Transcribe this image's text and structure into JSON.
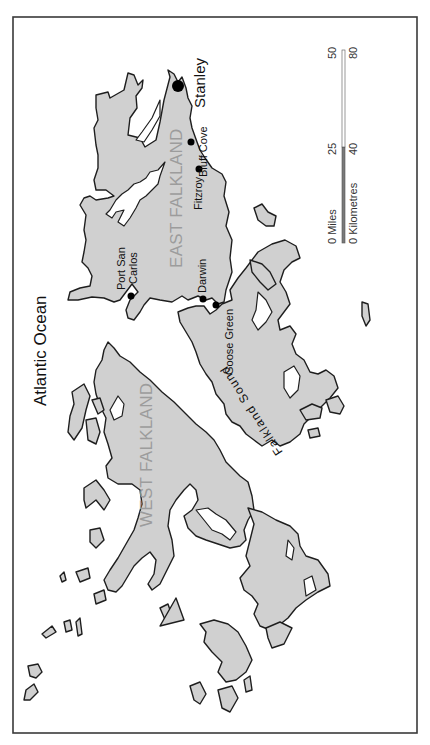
{
  "map": {
    "orientation": "rotated 90 degrees counter-clockwise (north toward right)",
    "colors": {
      "land": "#d0d0d0",
      "coastline": "#1e1e1e",
      "sea": "#ffffff",
      "island_label": "#9c9c9c",
      "frame": "#3a3a3a"
    },
    "labels": {
      "ocean": "Atlantic Ocean",
      "sound": "Falkland Sound",
      "east_island": "EAST FALKLAND",
      "west_island": "WEST FALKLAND"
    },
    "settlements": [
      {
        "name": "Stanley",
        "type": "capital"
      },
      {
        "name": "Bluff Cove",
        "type": "settlement"
      },
      {
        "name": "Fitzroy",
        "type": "settlement"
      },
      {
        "name": "Darwin",
        "type": "settlement"
      },
      {
        "name": "Goose Green",
        "type": "settlement"
      },
      {
        "name": "Port San",
        "type": "settlement-line1"
      },
      {
        "name": "Carlos",
        "type": "settlement-line2"
      }
    ],
    "scale_bar": {
      "miles_label": "0  Miles",
      "km_label": "0 Kilometres",
      "miles_mid": "25",
      "miles_end": "50",
      "km_mid": "40",
      "km_end": "80"
    }
  }
}
